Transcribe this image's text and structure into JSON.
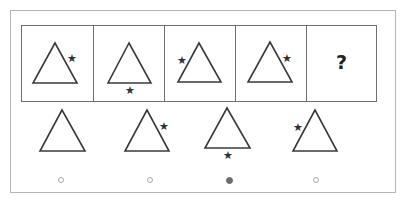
{
  "puzzle": {
    "sequence": [
      {
        "id": 1,
        "shape": "triangle",
        "star_position": "right-side"
      },
      {
        "id": 2,
        "shape": "triangle",
        "star_position": "below-base"
      },
      {
        "id": 3,
        "shape": "triangle",
        "star_position": "left-side"
      },
      {
        "id": 4,
        "shape": "triangle",
        "star_position": "right-side"
      },
      {
        "id": 5,
        "shape": "question",
        "label": "?"
      }
    ],
    "options": [
      {
        "id": "A",
        "shape": "triangle",
        "star_position": "none",
        "selected": false
      },
      {
        "id": "B",
        "shape": "triangle",
        "star_position": "right-side",
        "selected": false
      },
      {
        "id": "C",
        "shape": "triangle",
        "star_position": "below-base",
        "selected": true
      },
      {
        "id": "D",
        "shape": "triangle",
        "star_position": "left-side",
        "selected": false
      }
    ],
    "star_glyph": "★",
    "colors": {
      "stroke": "#3a3a3a",
      "star": "#333333",
      "radio_selected": "#6a6a6a",
      "radio_unselected": "#a8a8a8"
    }
  }
}
